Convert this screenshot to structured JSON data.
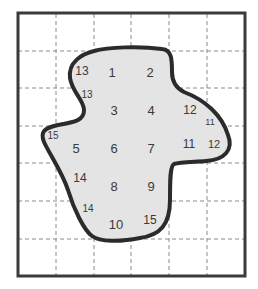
{
  "diagram": {
    "grid": {
      "columns": 6,
      "rows": 7,
      "line_style": "dashed",
      "line_color": "#8a8a8a",
      "frame_color": "#3a3a3a"
    },
    "shape": {
      "fill_color": "#e4e4e4",
      "outline_color": "#2b2b2b"
    },
    "labels": [
      {
        "text": "13",
        "x": 82,
        "y": 71,
        "size": 12
      },
      {
        "text": "1",
        "x": 112,
        "y": 72,
        "size": 13
      },
      {
        "text": "2",
        "x": 150,
        "y": 72,
        "size": 13
      },
      {
        "text": "13",
        "x": 87,
        "y": 94,
        "size": 10
      },
      {
        "text": "3",
        "x": 114,
        "y": 110,
        "size": 13
      },
      {
        "text": "4",
        "x": 151,
        "y": 110,
        "size": 13
      },
      {
        "text": "12",
        "x": 190,
        "y": 110,
        "size": 12
      },
      {
        "text": "11",
        "x": 210,
        "y": 122,
        "size": 9
      },
      {
        "text": "15",
        "x": 53,
        "y": 135,
        "size": 10
      },
      {
        "text": "5",
        "x": 76,
        "y": 148,
        "size": 13
      },
      {
        "text": "6",
        "x": 114,
        "y": 148,
        "size": 13
      },
      {
        "text": "7",
        "x": 151,
        "y": 148,
        "size": 13
      },
      {
        "text": "11",
        "x": 189,
        "y": 144,
        "size": 12
      },
      {
        "text": "12",
        "x": 214,
        "y": 144,
        "size": 11
      },
      {
        "text": "14",
        "x": 80,
        "y": 178,
        "size": 12
      },
      {
        "text": "8",
        "x": 114,
        "y": 186,
        "size": 13
      },
      {
        "text": "9",
        "x": 151,
        "y": 186,
        "size": 13
      },
      {
        "text": "14",
        "x": 88,
        "y": 208,
        "size": 10
      },
      {
        "text": "10",
        "x": 116,
        "y": 224,
        "size": 13
      },
      {
        "text": "15",
        "x": 150,
        "y": 220,
        "size": 12
      }
    ]
  }
}
